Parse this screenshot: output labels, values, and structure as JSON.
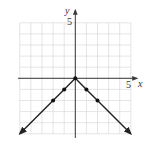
{
  "chart_data": {
    "type": "line",
    "title": "",
    "xlabel": "x",
    "ylabel": "y",
    "xlim": [
      -5,
      5
    ],
    "ylim": [
      -5,
      5
    ],
    "grid": true,
    "grid_step": 1,
    "tick_labels": {
      "x": [
        "5"
      ],
      "y": [
        "5"
      ]
    },
    "function": "y = -|x|",
    "series": [
      {
        "name": "y = -|x|",
        "x": [
          -5,
          -2,
          -1,
          0,
          1,
          2,
          5
        ],
        "y": [
          -5,
          -2,
          -1,
          0,
          -1,
          -2,
          -5
        ]
      }
    ],
    "marked_points": [
      {
        "x": -2,
        "y": -2
      },
      {
        "x": -1,
        "y": -1
      },
      {
        "x": 0,
        "y": 0
      },
      {
        "x": 1,
        "y": -1
      },
      {
        "x": 2,
        "y": -2
      }
    ],
    "arrows_at_ends": true
  },
  "labels": {
    "x_axis": "x",
    "y_axis": "y",
    "x_tick": "5",
    "y_tick": "5"
  },
  "colors": {
    "grid": "#d4d4d4",
    "axis": "#3a3a3a",
    "curve": "#222222"
  }
}
